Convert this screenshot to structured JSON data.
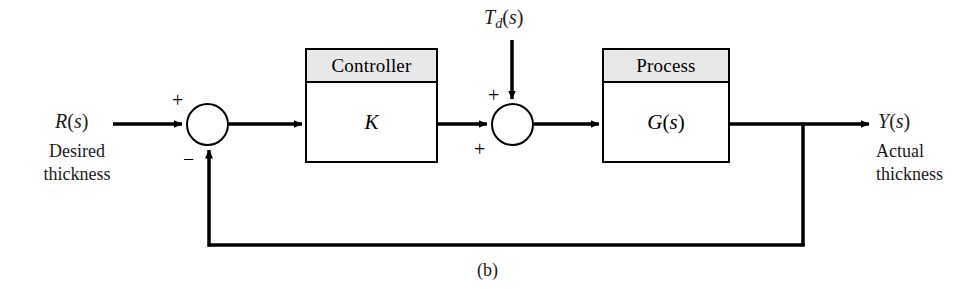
{
  "figure": {
    "caption": "(b)",
    "type": "control-system-block-diagram"
  },
  "signals": {
    "input": {
      "name_main": "R",
      "name_arg": "(s)",
      "desc_line1": "Desired",
      "desc_line2": "thickness"
    },
    "disturbance": {
      "name_main": "T",
      "name_sub": "d",
      "name_arg": "(s)"
    },
    "output": {
      "name_main": "Y",
      "name_arg": "(s)",
      "desc_line1": "Actual",
      "desc_line2": "thickness"
    }
  },
  "blocks": [
    {
      "id": "controller",
      "header": "Controller",
      "body": "K"
    },
    {
      "id": "process",
      "header": "Process",
      "body": "G(s)"
    }
  ],
  "summing_junctions": [
    {
      "id": "error-junction",
      "sign_reference": "+",
      "sign_feedback": "−"
    },
    {
      "id": "disturbance-junction",
      "sign_forward": "+",
      "sign_disturbance": "+"
    }
  ],
  "colors": {
    "line": "#000000",
    "block_header_fill": "#e8e8e8",
    "block_body_fill": "#ffffff",
    "text": "#1a1a1a",
    "background": "#ffffff"
  }
}
